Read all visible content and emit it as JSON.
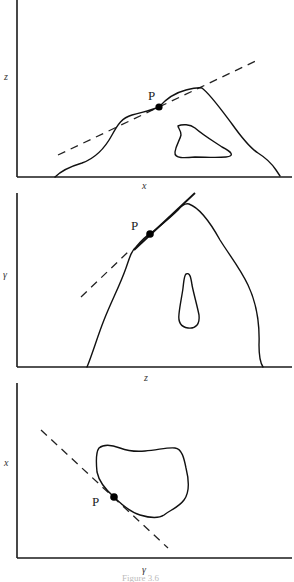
{
  "figure": {
    "caption": "Figure 3.6",
    "panels": [
      {
        "id": "xz",
        "vertical_axis_label": "z",
        "horizontal_axis_label": "x",
        "point_label": "P",
        "description": "Projection onto x–z plane: outer boundary with inner hole; dashed tangent line touching boundary at P"
      },
      {
        "id": "zy",
        "vertical_axis_label": "γ",
        "horizontal_axis_label": "z",
        "point_label": "P",
        "description": "Projection onto z–y plane: outer boundary with teardrop-shaped hole; tangent line touching boundary at P"
      },
      {
        "id": "yx",
        "vertical_axis_label": "x",
        "horizontal_axis_label": "γ",
        "point_label": "P",
        "description": "Projection onto y–x plane: closed blob; dashed tangent line touching boundary at P"
      }
    ]
  },
  "colors": {
    "ink": "#111111",
    "background": "#ffffff",
    "caption": "#bbbbbb"
  }
}
